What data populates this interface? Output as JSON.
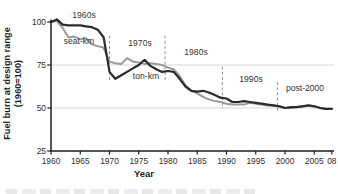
{
  "chart_data": {
    "type": "line",
    "xlabel": "Year",
    "ylabel": "Fuel burn at design range (1960=100)",
    "ylabel_line1": "Fuel burn at design range",
    "ylabel_line2": "(1960=100)",
    "x_start": 1960,
    "x_end": 2008,
    "x_ticks": [
      1960,
      1965,
      1970,
      1975,
      1980,
      1985,
      1990,
      1995,
      2000,
      2005,
      2008
    ],
    "x_tick_labels": [
      "1960",
      "1965",
      "1970",
      "1975",
      "1980",
      "1985",
      "1990",
      "1995",
      "2000",
      "2005",
      "08"
    ],
    "y_ticks": [
      25,
      50,
      75,
      100
    ],
    "ylim": [
      25,
      104
    ],
    "grid_values": [
      50,
      75
    ],
    "grid_on": true,
    "legend_position": "inline-labels",
    "series": [
      {
        "name": "seat-km",
        "color": "#9a9a9a",
        "width": 2.0,
        "values": [
          100,
          100.5,
          96.5,
          91,
          91.5,
          90,
          90.5,
          87,
          86,
          85,
          77,
          76,
          75.5,
          79,
          77,
          76.5,
          75.5,
          76,
          75.5,
          75,
          73.5,
          72.5,
          68.5,
          63,
          60,
          58.5,
          56.5,
          55,
          54,
          53.5,
          52.5,
          52,
          52,
          52,
          53,
          52.5,
          52,
          51.5,
          51.5,
          51,
          50,
          50,
          50.5,
          51,
          51.5,
          51,
          50,
          49.5,
          49.5
        ]
      },
      {
        "name": "ton-km",
        "color": "#2b2b2b",
        "width": 2.2,
        "values": [
          100,
          101.5,
          98.5,
          98,
          98,
          98,
          97.5,
          97,
          95.5,
          91,
          71,
          67,
          69,
          71,
          73,
          75,
          78,
          74.5,
          72.5,
          71,
          71.5,
          71,
          67,
          62.5,
          60,
          59.5,
          60,
          59,
          57.5,
          56,
          55.5,
          53.5,
          53.5,
          54,
          53.5,
          53,
          52.5,
          52,
          51.5,
          51,
          50,
          50.5,
          50.5,
          51,
          51.5,
          51,
          50,
          49.5,
          49.5
        ]
      }
    ],
    "decade_dividers": [
      {
        "year": 1970,
        "v_top": 92,
        "v_bottom": 66
      },
      {
        "year": 1979.5,
        "v_top": 92,
        "v_bottom": 66
      },
      {
        "year": 1989.3,
        "v_top": 74,
        "v_bottom": 49.5
      },
      {
        "year": 1998.7,
        "v_top": 65,
        "v_bottom": 48.5
      }
    ],
    "annotations": [
      {
        "id": "decade-label-1960s",
        "text": "1960s",
        "x": 84,
        "y": 15
      },
      {
        "id": "series-label-seat-km",
        "text": "seat-km",
        "x": 79,
        "y": 41
      },
      {
        "id": "decade-label-1970s",
        "text": "1970s",
        "x": 140,
        "y": 43
      },
      {
        "id": "series-label-ton-km",
        "text": "ton-km",
        "x": 146,
        "y": 76
      },
      {
        "id": "decade-label-1980s",
        "text": "1980s",
        "x": 196,
        "y": 52
      },
      {
        "id": "decade-label-1990s",
        "text": "1990s",
        "x": 251,
        "y": 79
      },
      {
        "id": "decade-label-post-2000",
        "text": "post-2000",
        "x": 305,
        "y": 88
      }
    ]
  },
  "colors": {
    "axis": "#1f1f1f",
    "grid": "#d2d2d2",
    "divider": "#8a8a8a",
    "tick_text": "#2e2e2e"
  }
}
